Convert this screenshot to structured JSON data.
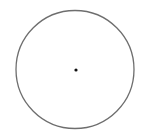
{
  "diagram": {
    "type": "circle-with-center",
    "circle": {
      "cx": 75,
      "cy": 69.5,
      "r": 59,
      "stroke": "#6e6e6e",
      "stroke_width": 1.3,
      "fill": "none"
    },
    "center_point": {
      "cx": 76,
      "cy": 70,
      "r": 1.6,
      "fill": "#111111"
    },
    "background": "#ffffff"
  }
}
